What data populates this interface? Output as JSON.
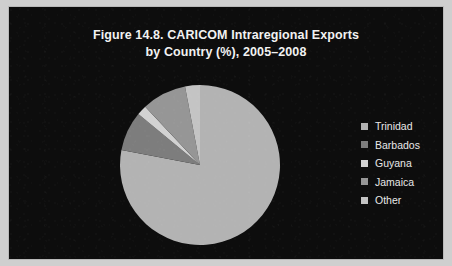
{
  "figure": {
    "title_line1": "Figure 14.8. CARICOM Intraregional Exports",
    "title_line2": "by Country (%), 2005–2008",
    "background_color": "#0d0d0d",
    "border_color": "#b9b9b9",
    "title_color": "#f2f2f2",
    "page_color": "#cfcfcf"
  },
  "legend": {
    "position": "right",
    "entries": [
      {
        "label": "Trinidad",
        "color": "#b3b3b3"
      },
      {
        "label": "Barbados",
        "color": "#7d7d7d"
      },
      {
        "label": "Guyana",
        "color": "#d2d2d2"
      },
      {
        "label": "Jamaica",
        "color": "#969696"
      },
      {
        "label": "Other",
        "color": "#c4c4c4"
      }
    ]
  },
  "chart_data": {
    "type": "pie",
    "title": "Figure 14.8. CARICOM Intraregional Exports by Country (%), 2005–2008",
    "xlabel": "",
    "ylabel": "",
    "unit": "%",
    "start_angle": 0,
    "direction": "clockwise",
    "legend_position": "right",
    "grid": false,
    "categories": [
      "Trinidad",
      "Barbados",
      "Guyana",
      "Jamaica",
      "Other"
    ],
    "values": [
      78,
      8,
      2,
      9,
      3
    ],
    "colors": [
      "#b3b3b3",
      "#7d7d7d",
      "#d2d2d2",
      "#969696",
      "#c4c4c4"
    ],
    "slices": [
      {
        "label": "Trinidad",
        "value": 78,
        "color": "#b3b3b3",
        "start_deg": 0,
        "end_deg": 280.8
      },
      {
        "label": "Barbados",
        "value": 8,
        "color": "#7d7d7d",
        "start_deg": 280.8,
        "end_deg": 309.6
      },
      {
        "label": "Guyana",
        "value": 2,
        "color": "#d2d2d2",
        "start_deg": 309.6,
        "end_deg": 316.8
      },
      {
        "label": "Jamaica",
        "value": 9,
        "color": "#969696",
        "start_deg": 316.8,
        "end_deg": 349.2
      },
      {
        "label": "Other",
        "value": 3,
        "color": "#c4c4c4",
        "start_deg": 349.2,
        "end_deg": 360
      }
    ]
  }
}
